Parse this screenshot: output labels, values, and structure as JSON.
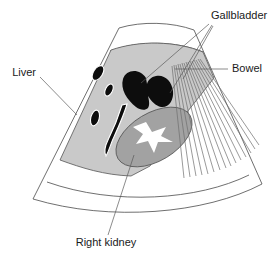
{
  "figure": {
    "kind": "ultrasound-sector-scan-diagram",
    "modality_shape": "sector",
    "background_color": "#ffffff",
    "width": 280,
    "height": 261
  },
  "labels": {
    "gallbladder": "Gallbladder",
    "bowel": "Bowel",
    "liver": "Liver",
    "right_kidney": "Right kidney"
  },
  "structures": {
    "liver": {
      "name": "Liver",
      "fill_color": "#c9c9c9",
      "outline_color": "#555555",
      "description": "homogeneous mid-grey parenchyma occupying the upper-left of the scan sector",
      "vessel_count": 4
    },
    "gallbladder": {
      "name": "Gallbladder",
      "fill_color": "#0d0d0d",
      "outline_color": "#0d0d0d",
      "description": "anechoic bilobed fluid-filled structure, black on ultrasound",
      "lobes": 2
    },
    "right_kidney": {
      "name": "Right kidney",
      "fill_color": "#a2a2a2",
      "outline_color": "#555555",
      "sinus_fill_color": "#ffffff",
      "description": "tilted ellipse of darker grey cortex with a bright white central renal sinus"
    },
    "bowel": {
      "name": "Bowel",
      "shadow_line_color": "#6e6e6e",
      "shadow_line_count": 15,
      "description": "gas-filled bowel casting a fan of posterior acoustic shadow lines toward the far field"
    }
  },
  "colors": {
    "background": "#ffffff",
    "sector_outline": "#4a4a4a",
    "leader_line": "#5a5a5a",
    "text": "#1a1a1a",
    "liver_grey": "#c9c9c9",
    "kidney_grey": "#a2a2a2",
    "anechoic_black": "#0d0d0d",
    "sinus_white": "#ffffff"
  }
}
